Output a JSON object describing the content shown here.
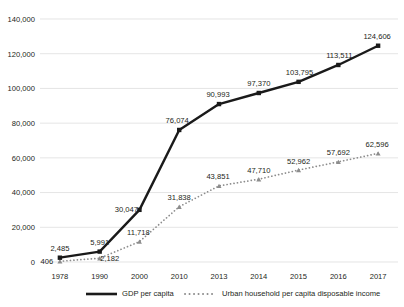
{
  "chart_data": {
    "type": "line",
    "title": "",
    "subtitle": "",
    "xlabel": "",
    "ylabel": "",
    "categories": [
      "1978",
      "1990",
      "2000",
      "2010",
      "2013",
      "2014",
      "2015",
      "2016",
      "2017"
    ],
    "ylim": [
      0,
      140000
    ],
    "yticks": [
      0,
      20000,
      40000,
      60000,
      80000,
      100000,
      120000,
      140000
    ],
    "ytick_labels": [
      "0",
      "20,000",
      "40,000",
      "60,000",
      "80,000",
      "100,000",
      "120,000",
      "140,000"
    ],
    "grid": true,
    "legend_position": "bottom",
    "series": [
      {
        "name": "GDP per capita",
        "marker": "square",
        "line_style": "solid",
        "color": "#1a1a1a",
        "values": [
          2485,
          5991,
          30047,
          76074,
          90993,
          97370,
          103795,
          113511,
          124606
        ],
        "labels": [
          "2,485",
          "5,991",
          "30,047",
          "76,074",
          "90,993",
          "97,370",
          "103,795",
          "113,511",
          "124,606"
        ]
      },
      {
        "name": "Urban household per capita disposable income",
        "marker": "triangle",
        "line_style": "dotted",
        "color": "#8c8c8c",
        "values": [
          406,
          2182,
          11718,
          31838,
          43851,
          47710,
          52962,
          57692,
          62596
        ],
        "labels": [
          "406",
          "2,182",
          "11,718",
          "31,838",
          "43,851",
          "47,710",
          "52,962",
          "57,692",
          "62,596"
        ]
      }
    ]
  },
  "legend": {
    "items": [
      {
        "label": "GDP per capita"
      },
      {
        "label": "Urban household per capita disposable income"
      }
    ]
  }
}
